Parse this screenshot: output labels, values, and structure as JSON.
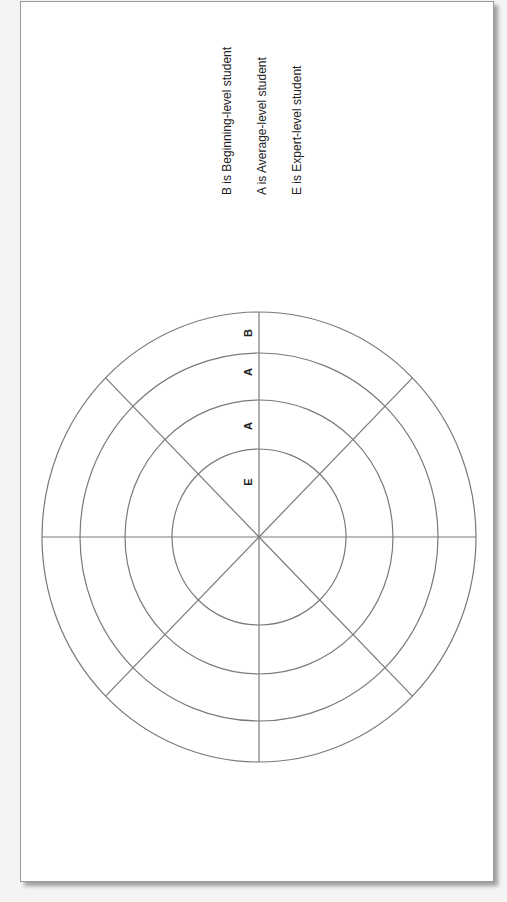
{
  "legend": {
    "items": [
      "B is Beginning-level student",
      "A is Average-level student",
      "E is Expert-level student"
    ]
  },
  "ring_labels": [
    "B",
    "A",
    "A",
    "E"
  ],
  "colors": {
    "stroke": "#7a7a7a",
    "text": "#222222",
    "page_bg": "#ffffff",
    "page_border": "#9a9a9a"
  },
  "chart_data": {
    "type": "radial-target-wheel",
    "title": "",
    "center": [
      259,
      537
    ],
    "rings": [
      {
        "label": "E",
        "rx": 87,
        "ry": 88
      },
      {
        "label": "A",
        "rx": 134,
        "ry": 137
      },
      {
        "label": "A",
        "rx": 179,
        "ry": 184
      },
      {
        "label": "B",
        "rx": 217,
        "ry": 225
      }
    ],
    "spokes": 8,
    "spoke_angles_deg": [
      0,
      45,
      90,
      135,
      180,
      225,
      270,
      315
    ],
    "legend": [
      "B is Beginning-level student",
      "A is Average-level student",
      "E is Expert-level student"
    ]
  }
}
